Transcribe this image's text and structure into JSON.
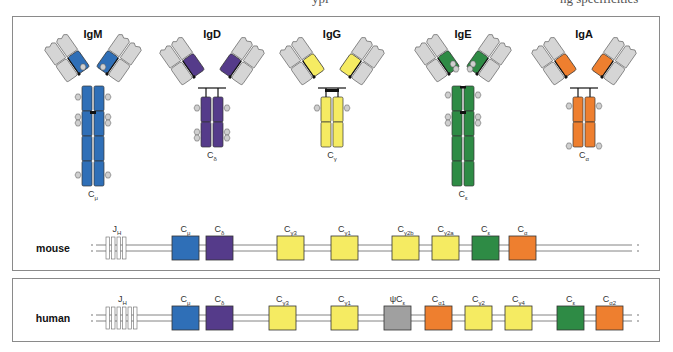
{
  "header_fragment": {
    "left": "ypi",
    "right": "ng specificities"
  },
  "colors": {
    "mu": "#2f6fb7",
    "delta": "#553b8a",
    "gamma": "#f5eb62",
    "epsilon": "#2e8b45",
    "alpha": "#ee7f2f",
    "pseudo": "#a0a0a0",
    "variable": "#d5d5d5",
    "stroke": "#333333"
  },
  "antibodies": [
    {
      "name": "IgM",
      "chain": "C",
      "sub": "μ",
      "color_key": "mu"
    },
    {
      "name": "IgD",
      "chain": "C",
      "sub": "δ",
      "color_key": "delta"
    },
    {
      "name": "IgG",
      "chain": "C",
      "sub": "γ",
      "color_key": "gamma"
    },
    {
      "name": "IgE",
      "chain": "C",
      "sub": "ε",
      "color_key": "epsilon"
    },
    {
      "name": "IgA",
      "chain": "C",
      "sub": "α",
      "color_key": "alpha"
    }
  ],
  "loci": {
    "mouse": {
      "label": "mouse",
      "jh": {
        "main": "J",
        "sub": "H"
      },
      "genes": [
        {
          "main": "C",
          "sub": "μ",
          "color_key": "mu"
        },
        {
          "main": "C",
          "sub": "δ",
          "color_key": "delta"
        },
        {
          "main": "C",
          "sub": "γ3",
          "color_key": "gamma"
        },
        {
          "main": "C",
          "sub": "γ1",
          "color_key": "gamma"
        },
        {
          "main": "C",
          "sub": "γ2b",
          "color_key": "gamma"
        },
        {
          "main": "C",
          "sub": "γ2a",
          "color_key": "gamma"
        },
        {
          "main": "C",
          "sub": "ε",
          "color_key": "epsilon"
        },
        {
          "main": "C",
          "sub": "α",
          "color_key": "alpha"
        }
      ]
    },
    "human": {
      "label": "human",
      "jh": {
        "main": "J",
        "sub": "H"
      },
      "genes": [
        {
          "main": "C",
          "sub": "μ",
          "color_key": "mu"
        },
        {
          "main": "C",
          "sub": "δ",
          "color_key": "delta"
        },
        {
          "main": "C",
          "sub": "γ3",
          "color_key": "gamma"
        },
        {
          "main": "C",
          "sub": "γ1",
          "color_key": "gamma"
        },
        {
          "main": "ψC",
          "sub": "ε",
          "color_key": "pseudo"
        },
        {
          "main": "C",
          "sub": "α1",
          "color_key": "alpha"
        },
        {
          "main": "C",
          "sub": "γ2",
          "color_key": "gamma"
        },
        {
          "main": "C",
          "sub": "γ4",
          "color_key": "gamma"
        },
        {
          "main": "C",
          "sub": "ε",
          "color_key": "epsilon"
        },
        {
          "main": "C",
          "sub": "α2",
          "color_key": "alpha"
        }
      ]
    }
  }
}
